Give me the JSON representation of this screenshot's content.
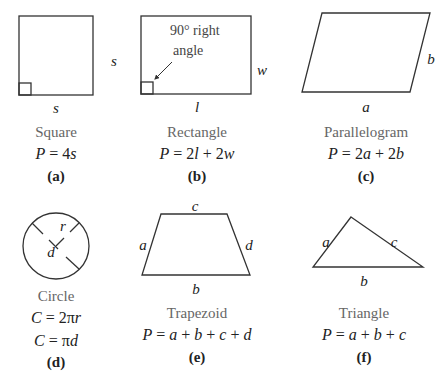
{
  "figures": [
    {
      "id": "a",
      "shape": "square",
      "name": "Square",
      "formula": "P = 4s",
      "tag": "(a)",
      "labels": {
        "bottom": "s",
        "right": "s"
      }
    },
    {
      "id": "b",
      "shape": "rectangle",
      "name": "Rectangle",
      "formula": "P = 2l + 2w",
      "tag": "(b)",
      "labels": {
        "bottom": "l",
        "right": "w"
      },
      "annotation_line1": "90° right",
      "annotation_line2": "angle"
    },
    {
      "id": "c",
      "shape": "parallelogram",
      "name": "Parallelogram",
      "formula": "P = 2a + 2b",
      "tag": "(c)",
      "labels": {
        "bottom": "a",
        "right": "b"
      }
    },
    {
      "id": "d",
      "shape": "circle",
      "name": "Circle",
      "formula": "C = 2πr",
      "formula2": "C = πd",
      "tag": "(d)",
      "labels": {
        "radius": "r",
        "diameter": "d"
      }
    },
    {
      "id": "e",
      "shape": "trapezoid",
      "name": "Trapezoid",
      "formula": "P = a + b + c + d",
      "tag": "(e)",
      "labels": {
        "top": "c",
        "left": "a",
        "right": "d",
        "bottom": "b"
      }
    },
    {
      "id": "f",
      "shape": "triangle",
      "name": "Triangle",
      "formula": "P = a + b + c",
      "tag": "(f)",
      "labels": {
        "left": "a",
        "right": "c",
        "bottom": "b"
      }
    }
  ],
  "colors": {
    "stroke": "#333333",
    "name_text": "#666666",
    "text": "#222222"
  }
}
